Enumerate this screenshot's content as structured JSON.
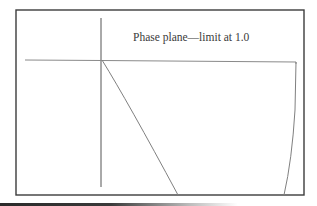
{
  "figure": {
    "title": "Phase plane—limit at 1.0",
    "colors": {
      "frame": "#3c3c3c",
      "axes": "#555555",
      "curves": "#808080",
      "text": "#3a3a3a"
    },
    "elements": {
      "frame": {
        "x": 16,
        "y": 10,
        "width": 288,
        "height": 185
      },
      "vertical_axis": {
        "x": 101,
        "y1": 18,
        "y2": 187
      },
      "horizontal_axis": {
        "y": 60,
        "x1": 25,
        "x2": 296
      },
      "curves": [
        {
          "name": "trajectory-left",
          "from": [
            102,
            60
          ],
          "to": [
            178,
            195
          ]
        },
        {
          "name": "limit-boundary-right",
          "from": [
            296,
            62
          ],
          "to": [
            284,
            195
          ]
        }
      ]
    }
  }
}
